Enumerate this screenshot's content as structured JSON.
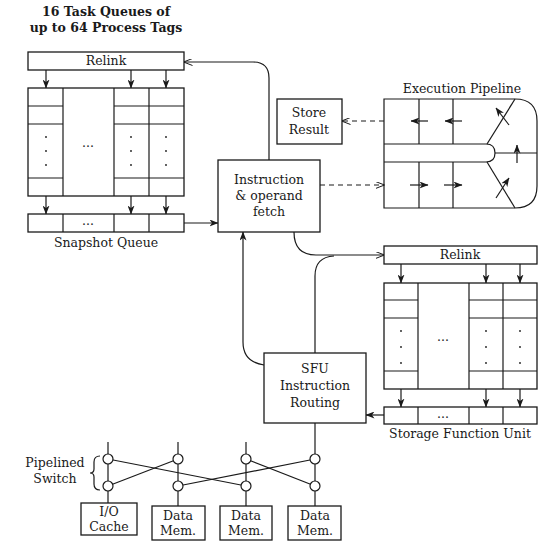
{
  "task_queues": {
    "title_line1": "16 Task Queues of",
    "title_line2": "up to 64 Process Tags",
    "relink_label": "Relink",
    "ellipsis": "...",
    "snapshot_label": "Snapshot Queue"
  },
  "fetch": {
    "line1": "Instruction",
    "line2": "& operand",
    "line3": "fetch"
  },
  "pipeline": {
    "title": "Execution Pipeline",
    "store_line1": "Store",
    "store_line2": "Result"
  },
  "sfu": {
    "relink_label": "Relink",
    "ellipsis": "...",
    "unit_label": "Storage Function Unit",
    "routing_line1": "SFU",
    "routing_line2": "Instruction",
    "routing_line3": "Routing"
  },
  "switch": {
    "label_line1": "Pipelined",
    "label_line2": "Switch",
    "memories": [
      {
        "line1": "I/O",
        "line2": "Cache"
      },
      {
        "line1": "Data",
        "line2": "Mem."
      },
      {
        "line1": "Data",
        "line2": "Mem."
      },
      {
        "line1": "Data",
        "line2": "Mem."
      }
    ]
  },
  "colors": {
    "ink": "#1a1a1a",
    "background": "#ffffff"
  }
}
